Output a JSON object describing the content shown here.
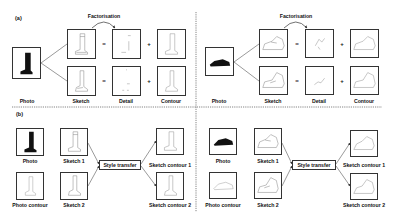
{
  "panel_a": {
    "label": "(a)",
    "factorisation_label": "Factorisation",
    "operators": {
      "equals": "=",
      "plus": "+"
    },
    "column_labels": {
      "photo": "Photo",
      "sketch": "Sketch",
      "detail": "Detail",
      "contour": "Contour"
    }
  },
  "panel_b": {
    "label": "(b)",
    "labels": {
      "photo": "Photo",
      "photo_contour": "Photo contour",
      "sketch1": "Sketch 1",
      "sketch2": "Sketch 2",
      "style_transfer": "Style transfer",
      "sketch_contour1": "Sketch contour 1",
      "sketch_contour2": "Sketch contour 2"
    }
  },
  "examples": [
    "boot",
    "shoe"
  ]
}
